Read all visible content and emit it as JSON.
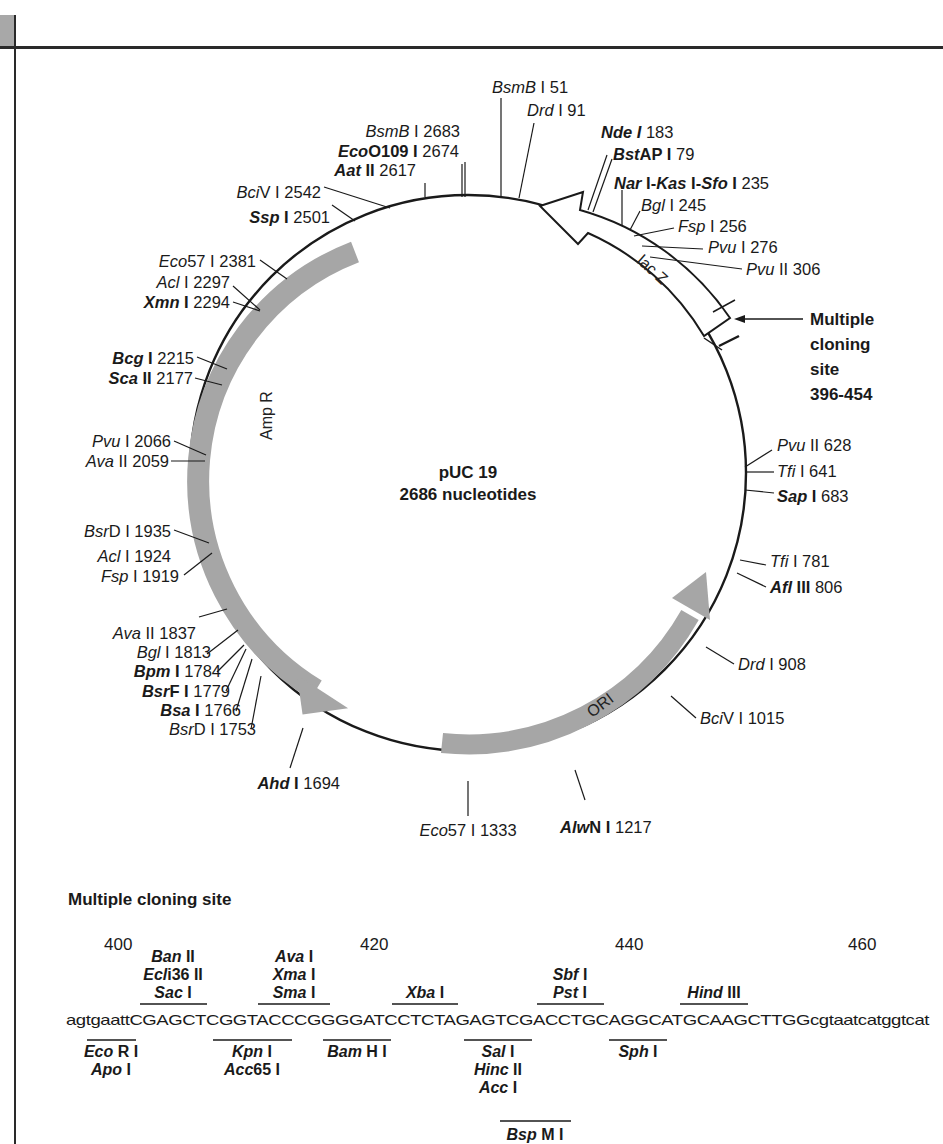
{
  "plasmid": {
    "name": "pUC 19",
    "size_label": "2686 nucleotides"
  },
  "features": {
    "lacz": "lac Z",
    "ampr": "Amp R",
    "ori": "ORI",
    "mcs_callout": [
      "Multiple",
      "cloning",
      "site",
      "396-454"
    ]
  },
  "sites": [
    {
      "id": "bsmb1-51",
      "parts": [
        [
          "BsmB",
          "it"
        ],
        [
          " I 51",
          ""
        ]
      ]
    },
    {
      "id": "drd1-91",
      "parts": [
        [
          "Drd",
          "it"
        ],
        [
          " I 91",
          ""
        ]
      ]
    },
    {
      "id": "nde1-183",
      "parts": [
        [
          "Nde I",
          "bi"
        ],
        [
          " 183",
          ""
        ]
      ]
    },
    {
      "id": "bstap1-79",
      "parts": [
        [
          "Bst",
          "bi"
        ],
        [
          "AP I",
          "b"
        ],
        [
          " 79",
          ""
        ]
      ]
    },
    {
      "id": "nar-kas-sfo-235",
      "parts": [
        [
          "Nar",
          "bi"
        ],
        [
          " I-",
          "b"
        ],
        [
          "Kas",
          "bi"
        ],
        [
          " I-",
          "b"
        ],
        [
          "Sfo",
          "bi"
        ],
        [
          " I",
          "b"
        ],
        [
          " 235",
          ""
        ]
      ]
    },
    {
      "id": "bgl1-245",
      "parts": [
        [
          "Bgl",
          "it"
        ],
        [
          " I 245",
          ""
        ]
      ]
    },
    {
      "id": "fsp1-256",
      "parts": [
        [
          "Fsp",
          "it"
        ],
        [
          " I 256",
          ""
        ]
      ]
    },
    {
      "id": "pvu1-276",
      "parts": [
        [
          "Pvu",
          "it"
        ],
        [
          " I 276",
          ""
        ]
      ]
    },
    {
      "id": "pvu2-306",
      "parts": [
        [
          "Pvu",
          "it"
        ],
        [
          " II 306",
          ""
        ]
      ]
    },
    {
      "id": "pvu2-628",
      "parts": [
        [
          "Pvu",
          "it"
        ],
        [
          " II 628",
          ""
        ]
      ]
    },
    {
      "id": "tfi1-641",
      "parts": [
        [
          "Tfi",
          "it"
        ],
        [
          " I 641",
          ""
        ]
      ]
    },
    {
      "id": "sap1-683",
      "parts": [
        [
          "Sap",
          "bi"
        ],
        [
          " I",
          "b"
        ],
        [
          " 683",
          ""
        ]
      ]
    },
    {
      "id": "tfi1-781",
      "parts": [
        [
          "Tfi",
          "it"
        ],
        [
          " I 781",
          ""
        ]
      ]
    },
    {
      "id": "afl3-806",
      "parts": [
        [
          "Afl",
          "bi"
        ],
        [
          " III",
          "b"
        ],
        [
          " 806",
          ""
        ]
      ]
    },
    {
      "id": "drd1-908",
      "parts": [
        [
          "Drd",
          "it"
        ],
        [
          " I 908",
          ""
        ]
      ]
    },
    {
      "id": "bciv1-1015",
      "parts": [
        [
          "Bci",
          "it"
        ],
        [
          "V I 1015",
          ""
        ]
      ]
    },
    {
      "id": "alwn1-1217",
      "parts": [
        [
          "Alw",
          "bi"
        ],
        [
          "N I",
          "b"
        ],
        [
          " 1217",
          ""
        ]
      ]
    },
    {
      "id": "eco57-1333",
      "parts": [
        [
          "Eco",
          "it"
        ],
        [
          "57 I 1333",
          ""
        ]
      ]
    },
    {
      "id": "ahd1-1694",
      "parts": [
        [
          "Ahd",
          "bi"
        ],
        [
          " I",
          "b"
        ],
        [
          " 1694",
          ""
        ]
      ]
    },
    {
      "id": "bsrd1-1753",
      "parts": [
        [
          "Bsr",
          "it"
        ],
        [
          "D I 1753",
          ""
        ]
      ]
    },
    {
      "id": "bsa1-1766",
      "parts": [
        [
          "Bsa",
          "bi"
        ],
        [
          " I",
          "b"
        ],
        [
          " 1766",
          ""
        ]
      ]
    },
    {
      "id": "bsrf1-1779",
      "parts": [
        [
          "Bsr",
          "bi"
        ],
        [
          "F I",
          "b"
        ],
        [
          " 1779",
          ""
        ]
      ]
    },
    {
      "id": "bpm1-1784",
      "parts": [
        [
          "Bpm",
          "bi"
        ],
        [
          " I",
          "b"
        ],
        [
          " 1784",
          ""
        ]
      ]
    },
    {
      "id": "bgl1-1813",
      "parts": [
        [
          "Bgl",
          "it"
        ],
        [
          " I 1813",
          ""
        ]
      ]
    },
    {
      "id": "ava2-1837",
      "parts": [
        [
          "Ava",
          "it"
        ],
        [
          " II 1837",
          ""
        ]
      ]
    },
    {
      "id": "fsp1-1919",
      "parts": [
        [
          "Fsp",
          "it"
        ],
        [
          " I 1919",
          ""
        ]
      ]
    },
    {
      "id": "acl1-1924",
      "parts": [
        [
          "Acl",
          "it"
        ],
        [
          " I 1924",
          ""
        ]
      ]
    },
    {
      "id": "bsrd1-1935",
      "parts": [
        [
          "Bsr",
          "it"
        ],
        [
          "D I 1935",
          ""
        ]
      ]
    },
    {
      "id": "ava2-2059",
      "parts": [
        [
          "Ava",
          "it"
        ],
        [
          " II 2059",
          ""
        ]
      ]
    },
    {
      "id": "pvu1-2066",
      "parts": [
        [
          "Pvu",
          "it"
        ],
        [
          " I 2066",
          ""
        ]
      ]
    },
    {
      "id": "sca2-2177",
      "parts": [
        [
          "Sca",
          "bi"
        ],
        [
          " II",
          "b"
        ],
        [
          " 2177",
          ""
        ]
      ]
    },
    {
      "id": "bcg1-2215",
      "parts": [
        [
          "Bcg",
          "bi"
        ],
        [
          " I",
          "b"
        ],
        [
          " 2215",
          ""
        ]
      ]
    },
    {
      "id": "xmn1-2294",
      "parts": [
        [
          "Xmn",
          "bi"
        ],
        [
          " I",
          "b"
        ],
        [
          " 2294",
          ""
        ]
      ]
    },
    {
      "id": "acl1-2297",
      "parts": [
        [
          "Acl",
          "it"
        ],
        [
          " I 2297",
          ""
        ]
      ]
    },
    {
      "id": "eco57-2381",
      "parts": [
        [
          "Eco",
          "it"
        ],
        [
          "57 I 2381",
          ""
        ]
      ]
    },
    {
      "id": "ssp1-2501",
      "parts": [
        [
          "Ssp",
          "bi"
        ],
        [
          " I",
          "b"
        ],
        [
          " 2501",
          ""
        ]
      ]
    },
    {
      "id": "bciv1-2542",
      "parts": [
        [
          "Bci",
          "it"
        ],
        [
          "V I 2542",
          ""
        ]
      ]
    },
    {
      "id": "aat2-2617",
      "parts": [
        [
          "Aat",
          "bi"
        ],
        [
          " II",
          "b"
        ],
        [
          " 2617",
          ""
        ]
      ]
    },
    {
      "id": "eco0109-2674",
      "parts": [
        [
          "Eco",
          "bi"
        ],
        [
          "O109 I",
          "b"
        ],
        [
          " 2674",
          ""
        ]
      ]
    },
    {
      "id": "bsmb1-2683",
      "parts": [
        [
          "BsmB",
          "it"
        ],
        [
          " I 2683",
          ""
        ]
      ]
    }
  ],
  "mcs": {
    "title": "Multiple cloning site",
    "positions": [
      "400",
      "420",
      "440",
      "460"
    ],
    "sequence": "agtgaattCGAGCTCGGTACCCGGGGATCCTCTAGAGTCGACCTGCAGGCATGCAAGCTTGGcgtaatcatggtcat",
    "above": [
      {
        "lines": [
          [
            "Ban",
            "II"
          ],
          [
            "Ecl",
            "i36 II"
          ],
          [
            "Sac",
            "I"
          ]
        ]
      },
      {
        "lines": [
          [
            "Ava",
            "I"
          ],
          [
            "Xma",
            "I"
          ],
          [
            "Sma",
            "I"
          ]
        ]
      },
      {
        "lines": [
          [
            "Xba",
            "I"
          ]
        ]
      },
      {
        "lines": [
          [
            "Sbf",
            "I"
          ],
          [
            "Pst",
            "I"
          ]
        ]
      },
      {
        "lines": [
          [
            "Hind",
            "III"
          ]
        ]
      }
    ],
    "below": [
      {
        "lines": [
          [
            "Eco",
            "R I"
          ],
          [
            "Apo",
            "I"
          ]
        ]
      },
      {
        "lines": [
          [
            "Kpn",
            "I"
          ],
          [
            "Acc",
            "65 I"
          ]
        ]
      },
      {
        "lines": [
          [
            "Bam",
            "H I"
          ]
        ]
      },
      {
        "lines": [
          [
            "Sal",
            "I"
          ],
          [
            "Hinc",
            "II"
          ],
          [
            "Acc",
            "I"
          ]
        ]
      },
      {
        "lines": [
          [
            "Sph",
            "I"
          ]
        ]
      },
      {
        "lines": [
          [
            "Bsp",
            "M I"
          ]
        ]
      }
    ]
  }
}
